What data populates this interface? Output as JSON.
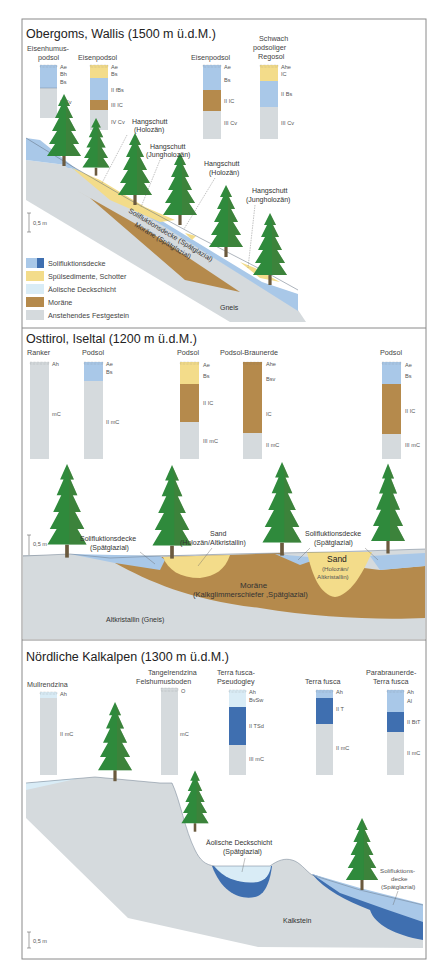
{
  "colors": {
    "solifluktion_light": "#a9c8e8",
    "solifluktion_dark": "#3f6fb0",
    "spuelsedimente": "#f3dc8a",
    "aeolisch": "#d9ecf6",
    "moraene": "#b58a4c",
    "festgestein": "#d5dadd",
    "tree_green": "#2e8b3a",
    "trunk": "#6b5a3e",
    "frame": "#888888"
  },
  "panels": [
    {
      "title": "Obergoms, Wallis (1500 m ü.d.M.)",
      "profiles": [
        {
          "name_lines": [
            "Eisenhumus-",
            "podsol"
          ],
          "horizons": [
            "Ae",
            "Bh",
            "Bs",
            "II Cv"
          ]
        },
        {
          "name_lines": [
            "Eisenpodsol"
          ],
          "horizons": [
            "Ae",
            "Bs",
            "II fBs",
            "III IC",
            "IV Cv"
          ]
        },
        {
          "name_lines": [
            "Eisenpodsol"
          ],
          "horizons": [
            "Ae",
            "Bs",
            "II IC",
            "III Cv"
          ]
        },
        {
          "name_lines": [
            "Schwach",
            "podsoliger",
            "Regosol"
          ],
          "horizons": [
            "Ahe",
            "IC",
            "II Bs",
            "III Cv"
          ]
        }
      ],
      "annotations": [
        {
          "lines": [
            "Hangschutt",
            "(Holozän)"
          ]
        },
        {
          "lines": [
            "Hangschutt",
            "(Jungholozän)"
          ]
        },
        {
          "lines": [
            "Hangschutt",
            "(Holozän)"
          ]
        },
        {
          "lines": [
            "Hangschutt",
            "(Jungholozän)"
          ]
        }
      ],
      "layer_labels": {
        "solifluktion": "Solifluktionsdecke (Spätglazial)",
        "moraene": "Moräne (Spätglazial)",
        "gneis": "Gneis"
      },
      "scale": "0,5 m",
      "legend": [
        {
          "label": "Solifluktionsdecke",
          "key": "solifluktion"
        },
        {
          "label": "Spülsedimente, Schotter",
          "key": "spuelsedimente"
        },
        {
          "label": "Äolische Deckschicht",
          "key": "aeolisch"
        },
        {
          "label": "Moräne",
          "key": "moraene"
        },
        {
          "label": "Anstehendes Festgestein",
          "key": "festgestein"
        }
      ]
    },
    {
      "title": "Osttirol, Iseltal (1200 m ü.d.M.)",
      "profiles": [
        {
          "name_lines": [
            "Ranker"
          ],
          "horizons": [
            "Ah",
            "mC"
          ]
        },
        {
          "name_lines": [
            "Podsol"
          ],
          "horizons": [
            "Ae",
            "Bs",
            "II mC"
          ]
        },
        {
          "name_lines": [
            "Podsol"
          ],
          "horizons": [
            "Ae",
            "Bs",
            "II IC",
            "III mC"
          ]
        },
        {
          "name_lines": [
            "Podsol-Braunerde"
          ],
          "horizons": [
            "Ahe",
            "Bsv",
            "IC",
            "II mC"
          ]
        },
        {
          "name_lines": [
            "Podsol"
          ],
          "horizons": [
            "Ae",
            "Bs",
            "II IC",
            "III mC"
          ]
        }
      ],
      "annotations": [
        {
          "lines": [
            "Solifluktionsdecke",
            "(Spätglazial)"
          ]
        },
        {
          "lines": [
            "Sand",
            "(Holozän/Altkristallin)"
          ]
        },
        {
          "lines": [
            "Solifluktionsdecke",
            "(Spätglazial)"
          ]
        },
        {
          "lines": [
            "Sand",
            "(Holozän/",
            "Altkristallin)"
          ]
        }
      ],
      "layer_labels": {
        "moraene_lines": [
          "Moräne",
          "(Kalkglimmerschiefer ,Spätglazial)"
        ],
        "bedrock": "Altkristallin (Gneis)"
      },
      "scale": "0,5 m"
    },
    {
      "title": "Nördliche Kalkalpen (1300 m ü.d.M.)",
      "profiles": [
        {
          "name_lines": [
            "Mullrendzina"
          ],
          "horizons": [
            "Ah",
            "II mC"
          ]
        },
        {
          "name_lines": [
            "Tangelrendzina",
            "Felshumusboden"
          ],
          "horizons": [
            "O",
            "mC"
          ]
        },
        {
          "name_lines": [
            "Terra fusca-",
            "Pseudogley"
          ],
          "horizons": [
            "Ah",
            "BvSw",
            "II TSd",
            "III mC"
          ]
        },
        {
          "name_lines": [
            "Terra fusca"
          ],
          "horizons": [
            "Ah",
            "II T",
            "II mC"
          ]
        },
        {
          "name_lines": [
            "Parabraunerde-",
            "Terra fusca"
          ],
          "horizons": [
            "Ah",
            "Al",
            "II BtT",
            "II mC"
          ]
        }
      ],
      "annotations": [
        {
          "lines": [
            "Äolische Deckschicht",
            "(Spätglazial)"
          ]
        },
        {
          "lines": [
            "Solifluktions-",
            "decke",
            "(Spätglazial)"
          ]
        }
      ],
      "layer_labels": {
        "bedrock": "Kalkstein"
      },
      "scale": "0,5 m"
    }
  ]
}
